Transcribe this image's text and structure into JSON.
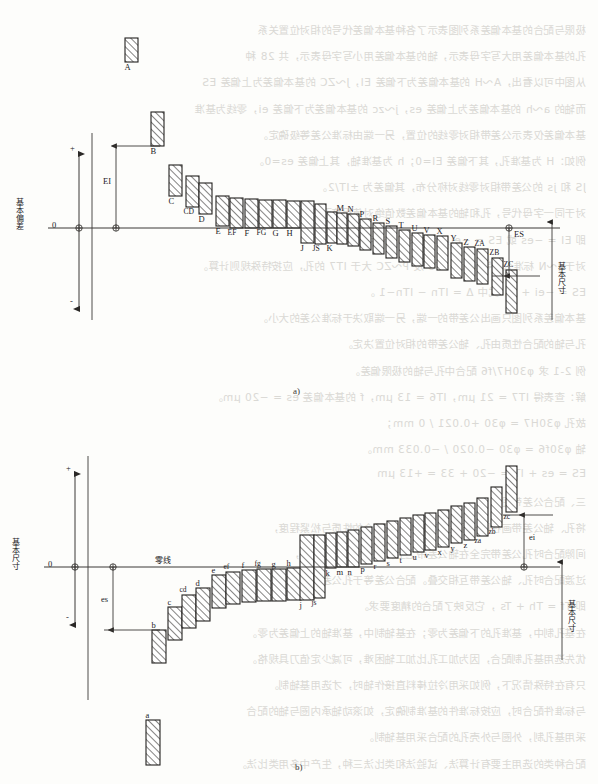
{
  "page": {
    "width": 598,
    "height": 784,
    "background_color": "#fdfdfb",
    "ink_color": "#23211f",
    "ghost_text_color": "#cfcdc9",
    "note": "Scanned textbook page: ISO/GB basic-deviation series diagram with faint show-through text from the reverse page"
  },
  "ghost_text": {
    "description": "faint mirrored show-through Chinese text from reverse page",
    "lines": [
      "极限与配合的基本偏差系列图表示了各种基本偏差代号的相对位置关系",
      "孔的基本偏差用大写字母表示，轴的基本偏差用小写字母表示，共 28 种",
      "从图中可以看出，A～H 的基本偏差为下偏差 EI，J～ZC 的基本偏差为上偏差 ES",
      "而轴的 a～h 的基本偏差为上偏差 es，j～zc 的基本偏差为下偏差 ei，零线为基准",
      "基本偏差仅表示公差带相对零线的位置，另一端由标准公差等级确定。",
      "例如：H 为基准孔，其下偏差 EI=0；h 为基准轴，其上偏差 es=0。",
      "JS 和 js 的公差带相对零线对称分布，其偏差为 ±IT/2。",
      "对于同一字母代号，孔和轴的基本偏差数值绝对值相等而符号相反，",
      "即 EI = −es 或 ES = −ei，此关系称为通用规则。",
      "对于 J～N 标准公差等级大于 IT8 及 P～ZC 大于 IT7 的孔，应按特殊规则计算。",
      "ES = −ei + Δ，式中 Δ = ITn − ITn−1 。",
      "基本偏差系列图只画出公差带的一端，另一端取决于标准公差的大小。",
      "孔与轴的配合性质由孔、轴公差带的相对位置决定。",
      "例 2-1  求 φ30H7/f6 配合中孔与轴的极限偏差。",
      "解：查表得 IT7 = 21 μm，IT6 = 13 μm，f 的基本偏差 es = −20 μm。",
      "故孔 φ30H7 = φ30 +0.021 / 0 mm；",
      "轴 φ30f6 = φ30 −0.020 / −0.033 mm。",
      "ES = es + IT = −20 + 33 = +13 μm",
      "三、配合公差带图",
      "将孔、轴公差带画在同一图上，可直观判断配合的性质与松紧程度，",
      "间隙配合时孔公差带完全在轴公差带之上，过盈配合时则相反，",
      "过渡配合时孔、轴公差带互相交叠。配合公差等于孔公差与轴公差之和，",
      "即 Tf = Th + Ts ，它反映了配合的精度要求。",
      "在基孔制中，基准孔的下偏差为零；在基轴制中，基准轴的上偏差为零。",
      "优先选用基孔制配合，因为加工孔比加工轴困难，可减少定值刀具规格。",
      "只有在特殊情况下，例如采用冷拉棒料直接作轴时，才选用基轴制。",
      "与标准件配合时，应按标准件的基准制确定，如滚动轴承内圈与轴的配合",
      "采用基孔制，外圈与外壳孔的配合采用基轴制。",
      "配合种类的选用主要有计算法、试验法和类比法三种，生产中多用类比法。"
    ]
  },
  "chart_data": [
    {
      "id": "figure-a",
      "type": "bar",
      "caption": "a)",
      "title": "Hole basic deviations (uppercase letters)",
      "axis_left_label": "基本偏差",
      "axis_left_zero": "0",
      "axis_right_label": "基本尺寸",
      "dimension_labels": [
        "EI",
        "ES"
      ],
      "sign_labels": [
        "+",
        "-"
      ],
      "orientation": "holes-above-and-below-zero-line",
      "note": "A..H lie above zero line (EI is lower deviation); J..ZC lie below zero line (ES is upper deviation)",
      "bars": [
        {
          "label": "A",
          "x": 125,
          "w": 13,
          "top": 38,
          "bottom": 62,
          "side": "above",
          "detached": true
        },
        {
          "label": "B",
          "x": 151,
          "w": 13,
          "top": 112,
          "bottom": 146,
          "side": "above"
        },
        {
          "label": "C",
          "x": 169,
          "w": 13,
          "top": 165,
          "bottom": 196,
          "side": "above"
        },
        {
          "label": "CD",
          "x": 186,
          "w": 13,
          "top": 176,
          "bottom": 207,
          "side": "above"
        },
        {
          "label": "D",
          "x": 199,
          "w": 13,
          "top": 183,
          "bottom": 214,
          "side": "above"
        },
        {
          "label": "E",
          "x": 216,
          "w": 13,
          "top": 196,
          "bottom": 226,
          "side": "above"
        },
        {
          "label": "EF",
          "x": 230,
          "w": 13,
          "top": 198,
          "bottom": 228,
          "side": "above"
        },
        {
          "label": "F",
          "x": 245,
          "w": 13,
          "top": 199,
          "bottom": 228,
          "side": "above"
        },
        {
          "label": "FG",
          "x": 259,
          "w": 13,
          "top": 200,
          "bottom": 228,
          "side": "above"
        },
        {
          "label": "G",
          "x": 273,
          "w": 13,
          "top": 200,
          "bottom": 228,
          "side": "above"
        },
        {
          "label": "H",
          "x": 287,
          "w": 13,
          "top": 201,
          "bottom": 228,
          "side": "above"
        },
        {
          "label": "J",
          "x": 301,
          "w": 13,
          "top": 201,
          "bottom": 243,
          "side": "straddle"
        },
        {
          "label": "JS",
          "x": 315,
          "w": 11,
          "top": 204,
          "bottom": 244,
          "side": "straddle"
        },
        {
          "label": "K",
          "x": 327,
          "w": 10,
          "top": 212,
          "bottom": 243,
          "side": "below"
        },
        {
          "label": "M",
          "x": 337,
          "w": 10,
          "top": 213,
          "bottom": 244,
          "side": "below"
        },
        {
          "label": "N",
          "x": 348,
          "w": 11,
          "top": 214,
          "bottom": 246,
          "side": "below"
        },
        {
          "label": "P",
          "x": 360,
          "w": 11,
          "top": 219,
          "bottom": 250,
          "side": "below"
        },
        {
          "label": "R",
          "x": 373,
          "w": 11,
          "top": 223,
          "bottom": 254,
          "side": "below"
        },
        {
          "label": "S",
          "x": 386,
          "w": 11,
          "top": 226,
          "bottom": 258,
          "side": "below"
        },
        {
          "label": "T",
          "x": 399,
          "w": 11,
          "top": 230,
          "bottom": 262,
          "side": "below"
        },
        {
          "label": "U",
          "x": 412,
          "w": 11,
          "top": 233,
          "bottom": 266,
          "side": "below"
        },
        {
          "label": "V",
          "x": 424,
          "w": 11,
          "top": 235,
          "bottom": 268,
          "side": "below"
        },
        {
          "label": "X",
          "x": 437,
          "w": 11,
          "top": 236,
          "bottom": 270,
          "side": "below"
        },
        {
          "label": "Y",
          "x": 451,
          "w": 11,
          "top": 243,
          "bottom": 278,
          "side": "below"
        },
        {
          "label": "Z",
          "x": 464,
          "w": 11,
          "top": 247,
          "bottom": 281,
          "side": "below"
        },
        {
          "label": "ZA",
          "x": 477,
          "w": 11,
          "top": 249,
          "bottom": 284,
          "side": "below"
        },
        {
          "label": "ZB",
          "x": 492,
          "w": 11,
          "top": 258,
          "bottom": 295,
          "side": "below"
        },
        {
          "label": "ZC",
          "x": 506,
          "w": 11,
          "top": 270,
          "bottom": 313,
          "side": "below"
        }
      ]
    },
    {
      "id": "figure-b",
      "type": "bar",
      "caption": "b)",
      "title": "Shaft basic deviations (lowercase letters)",
      "axis_left_label": "基本尺寸",
      "axis_left_zero": "0",
      "axis_right_label": "基本尺寸",
      "zero_line_label": "零线",
      "dimension_labels": [
        "es",
        "ei"
      ],
      "sign_labels": [
        "+",
        "-"
      ],
      "orientation": "shafts-below-and-above-zero-line",
      "note": "a..h lie below zero line (es is upper deviation); j..zc lie above zero line (ei is lower deviation)",
      "bars": [
        {
          "label": "a",
          "x": 146,
          "w": 14,
          "top": 720,
          "bottom": 765,
          "side": "below",
          "detached": true
        },
        {
          "label": "b",
          "x": 152,
          "w": 14,
          "top": 630,
          "bottom": 663,
          "side": "below"
        },
        {
          "label": "c",
          "x": 168,
          "w": 14,
          "top": 607,
          "bottom": 640,
          "side": "below"
        },
        {
          "label": "cd",
          "x": 182,
          "w": 14,
          "top": 595,
          "bottom": 628,
          "side": "below"
        },
        {
          "label": "d",
          "x": 196,
          "w": 14,
          "top": 588,
          "bottom": 621,
          "side": "below"
        },
        {
          "label": "e",
          "x": 212,
          "w": 14,
          "top": 575,
          "bottom": 608,
          "side": "below"
        },
        {
          "label": "ef",
          "x": 226,
          "w": 14,
          "top": 572,
          "bottom": 604,
          "side": "below"
        },
        {
          "label": "f",
          "x": 242,
          "w": 14,
          "top": 570,
          "bottom": 602,
          "side": "below"
        },
        {
          "label": "fg",
          "x": 257,
          "w": 14,
          "top": 569,
          "bottom": 601,
          "side": "below"
        },
        {
          "label": "g",
          "x": 272,
          "w": 14,
          "top": 569,
          "bottom": 601,
          "side": "below"
        },
        {
          "label": "h",
          "x": 287,
          "w": 14,
          "top": 568,
          "bottom": 600,
          "side": "below"
        },
        {
          "label": "j",
          "x": 300,
          "w": 14,
          "top": 535,
          "bottom": 600,
          "side": "straddle"
        },
        {
          "label": "js",
          "x": 314,
          "w": 11,
          "top": 535,
          "bottom": 598,
          "side": "straddle"
        },
        {
          "label": "k",
          "x": 326,
          "w": 10,
          "top": 533,
          "bottom": 568,
          "side": "above"
        },
        {
          "label": "m",
          "x": 337,
          "w": 10,
          "top": 532,
          "bottom": 567,
          "side": "above"
        },
        {
          "label": "n",
          "x": 348,
          "w": 11,
          "top": 530,
          "bottom": 567,
          "side": "above"
        },
        {
          "label": "p",
          "x": 361,
          "w": 11,
          "top": 527,
          "bottom": 564,
          "side": "above"
        },
        {
          "label": "r",
          "x": 374,
          "w": 11,
          "top": 524,
          "bottom": 561,
          "side": "above"
        },
        {
          "label": "s",
          "x": 387,
          "w": 11,
          "top": 521,
          "bottom": 558,
          "side": "above"
        },
        {
          "label": "t",
          "x": 400,
          "w": 11,
          "top": 518,
          "bottom": 555,
          "side": "above"
        },
        {
          "label": "u",
          "x": 413,
          "w": 11,
          "top": 515,
          "bottom": 552,
          "side": "above"
        },
        {
          "label": "v",
          "x": 425,
          "w": 11,
          "top": 513,
          "bottom": 550,
          "side": "above"
        },
        {
          "label": "x",
          "x": 438,
          "w": 11,
          "top": 510,
          "bottom": 547,
          "side": "above"
        },
        {
          "label": "y",
          "x": 451,
          "w": 11,
          "top": 506,
          "bottom": 543,
          "side": "above"
        },
        {
          "label": "z",
          "x": 464,
          "w": 11,
          "top": 503,
          "bottom": 540,
          "side": "above"
        },
        {
          "label": "za",
          "x": 477,
          "w": 11,
          "top": 498,
          "bottom": 536,
          "side": "above"
        },
        {
          "label": "zb",
          "x": 491,
          "w": 11,
          "top": 487,
          "bottom": 527,
          "side": "above"
        },
        {
          "label": "zc",
          "x": 506,
          "w": 11,
          "top": 466,
          "bottom": 512,
          "side": "above"
        }
      ]
    }
  ],
  "labels": {
    "deviation_upper_hole": "ES",
    "deviation_lower_hole": "EI",
    "deviation_upper_shaft": "es",
    "deviation_lower_shaft": "ei",
    "basic_deviation_cjk": "基本偏差",
    "basic_size_cjk": "基本尺寸",
    "zero_line_cjk": "零线",
    "zero": "0",
    "plus": "+",
    "minus": "-",
    "caption_a": "a)",
    "caption_b": "b)"
  }
}
